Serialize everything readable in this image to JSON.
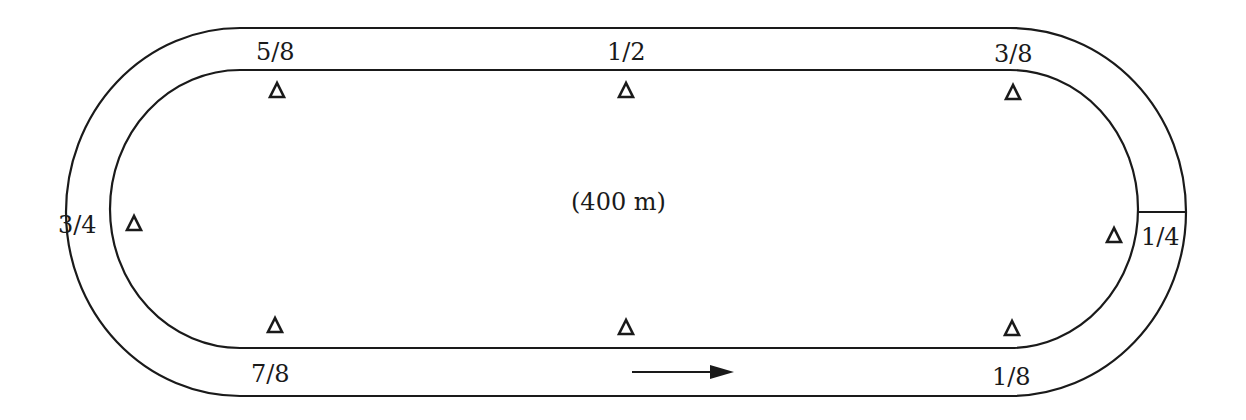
{
  "diagram": {
    "title": "(400 m)",
    "track_length": "400 m",
    "pole_labels": {
      "five_eighths": "5/8",
      "one_half": "1/2",
      "three_eighths": "3/8",
      "three_quarters": "3/4",
      "one_quarter": "1/4",
      "seven_eighths": "7/8",
      "one_eighth": "1/8"
    },
    "markers": [
      {
        "name": "5/8",
        "symbol": "triangle"
      },
      {
        "name": "1/2",
        "symbol": "triangle"
      },
      {
        "name": "3/8",
        "symbol": "triangle"
      },
      {
        "name": "3/4",
        "symbol": "triangle"
      },
      {
        "name": "1/4",
        "symbol": "triangle"
      },
      {
        "name": "7/8",
        "symbol": "triangle"
      },
      {
        "name": "1/2-bottom",
        "symbol": "triangle"
      },
      {
        "name": "1/8",
        "symbol": "triangle"
      }
    ],
    "direction": "right-arrow",
    "finish_line": "at 1/4 pole (right turn)",
    "colors": {
      "line": "#1a1a1a",
      "background": "#ffffff"
    }
  }
}
